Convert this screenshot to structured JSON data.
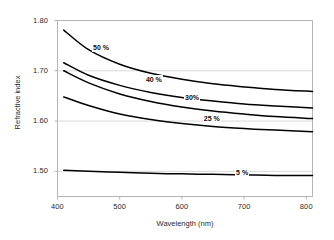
{
  "chart_data": {
    "type": "line",
    "title": "",
    "xlabel": "Wavelength (nm)",
    "ylabel": "Refractive index",
    "xlim": [
      400,
      810
    ],
    "ylim": [
      1.45,
      1.8
    ],
    "xticks": [
      "400",
      "500",
      "600",
      "700",
      "800"
    ],
    "xtick_values": [
      400,
      500,
      600,
      700,
      800
    ],
    "yticks": [
      "1.50",
      "1.60",
      "1.70",
      "1.80"
    ],
    "ytick_values": [
      1.5,
      1.6,
      1.7,
      1.8
    ],
    "grid": "horizontal",
    "legend_position": "inline-annotations",
    "line_color": "#000000",
    "grid_color": "#d8d8d8",
    "frame_color": "#b5b5b5",
    "x": [
      410,
      450,
      500,
      550,
      600,
      650,
      700,
      750,
      810
    ],
    "series": [
      {
        "name": "50 %",
        "label": "50 %",
        "label_x": 470,
        "label_y": 1.745,
        "values": [
          1.781,
          1.742,
          1.713,
          1.695,
          1.683,
          1.674,
          1.668,
          1.663,
          1.659
        ]
      },
      {
        "name": "40 %",
        "label": "40 %",
        "label_x": 555,
        "label_y": 1.682,
        "values": [
          1.716,
          1.691,
          1.671,
          1.657,
          1.647,
          1.64,
          1.634,
          1.63,
          1.626
        ]
      },
      {
        "name": "30%",
        "label": "30%",
        "label_x": 618,
        "label_y": 1.645,
        "values": [
          1.7,
          1.676,
          1.654,
          1.639,
          1.628,
          1.62,
          1.614,
          1.609,
          1.605
        ]
      },
      {
        "name": "25 %",
        "label": "25 %",
        "label_x": 648,
        "label_y": 1.604,
        "values": [
          1.648,
          1.631,
          1.614,
          1.603,
          1.595,
          1.589,
          1.585,
          1.582,
          1.579
        ]
      },
      {
        "name": "5 %",
        "label": "5 %",
        "label_x": 700,
        "label_y": 1.497,
        "values": [
          1.502,
          1.5,
          1.498,
          1.496,
          1.495,
          1.494,
          1.493,
          1.492,
          1.492
        ]
      }
    ]
  },
  "axes": {
    "ytick_0": "1.50",
    "ytick_1": "1.60",
    "ytick_2": "1.70",
    "ytick_3": "1.80",
    "xtick_0": "400",
    "xtick_1": "500",
    "xtick_2": "600",
    "xtick_3": "700",
    "xtick_4": "800",
    "xlabel": "Wavelength (nm)",
    "ylabel": "Refractive index"
  },
  "annotations": {
    "s50": "50 %",
    "s40": "40 %",
    "s30": "30%",
    "s25": "25 %",
    "s5": "5 %"
  }
}
